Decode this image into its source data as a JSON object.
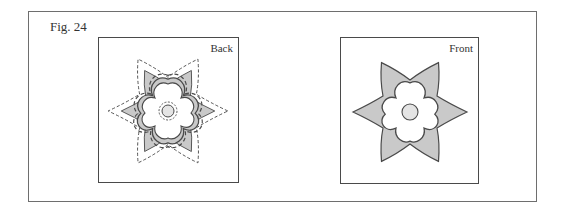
{
  "figure": {
    "label": "Fig. 24",
    "panels": [
      {
        "id": "back",
        "title": "Back"
      },
      {
        "id": "front",
        "title": "Front"
      }
    ]
  },
  "colors": {
    "petal_fill": "#c9c9c9",
    "center_fill": "#e4e4e4",
    "stroke": "#4a4a4a"
  }
}
